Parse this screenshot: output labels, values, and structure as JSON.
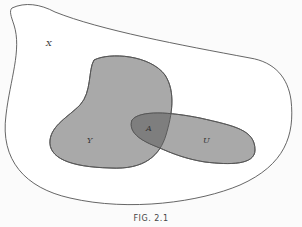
{
  "figure": {
    "caption": "FIG. 2.1",
    "type": "venn-diagram"
  },
  "sets": {
    "universe": {
      "label": "X",
      "fill": "#ffffff",
      "stroke": "#555555"
    },
    "y": {
      "label": "Y",
      "fill": "#a9a9a9",
      "stroke": "#555555"
    },
    "u": {
      "label": "U",
      "fill": "#a9a9a9",
      "stroke": "#555555"
    },
    "intersection": {
      "label": "A",
      "fill": "#7e7e7e",
      "description": "Y ∩ U"
    }
  },
  "colors": {
    "background": "#fbfbfb",
    "outline": "#555555",
    "region_fill": "#a9a9a9",
    "overlap_fill": "#7e7e7e"
  }
}
